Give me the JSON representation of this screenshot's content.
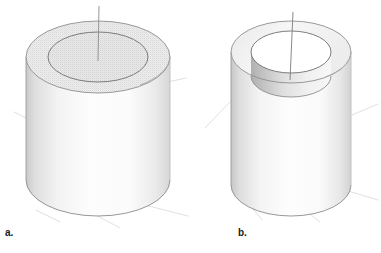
{
  "figure": {
    "kind": "technical-illustration",
    "background_color": "#ffffff",
    "width": 381,
    "height": 253,
    "outline_color": "#4a4a4a",
    "faint_line_color": "#dcdcdc",
    "axis_line_color": "#777777",
    "panels": [
      {
        "id": "a",
        "label": "a.",
        "label_x": 5,
        "label_y": 228,
        "object_name": "solid-cylinder-with-scribed-circle",
        "description": "Solid cylinder shown in isometric view with a circle drawn on the flat top face and a vertical centre axis line",
        "top_face_color": "#e7e7e7",
        "inner_circle_face_color": "#e0e0e0",
        "body_light_color": "#fdfdfd",
        "body_shadow_color": "#cfcfcf",
        "outer_top_center_x": 98,
        "outer_top_center_y": 57,
        "outer_top_rx": 72,
        "outer_top_ry": 36,
        "inner_circle_rx": 50,
        "inner_circle_ry": 25,
        "body_bottom_center_y": 180,
        "axis_top_y": 6,
        "axis_bottom_y": 62
      },
      {
        "id": "b",
        "label": "b.",
        "label_x": 238,
        "label_y": 228,
        "object_name": "hollow-cylinder-with-through-bore",
        "description": "Hollow tube shown in isometric view with a through hole revealing the inner bore wall and a vertical centre axis line",
        "top_face_color": "#f2f2f2",
        "bore_wall_light_color": "#f6f6f6",
        "bore_wall_shadow_color": "#b9b9b9",
        "bore_floor_color": "#ededed",
        "body_light_color": "#fdfdfd",
        "body_shadow_color": "#cfcfcf",
        "outer_top_center_x": 291,
        "outer_top_center_y": 52,
        "outer_top_rx": 60,
        "outer_top_ry": 31,
        "bore_top_rx": 40,
        "bore_top_ry": 21,
        "bore_bottom_center_y": 76,
        "body_bottom_center_y": 185,
        "axis_top_y": 12,
        "axis_bottom_y": 80
      }
    ]
  }
}
